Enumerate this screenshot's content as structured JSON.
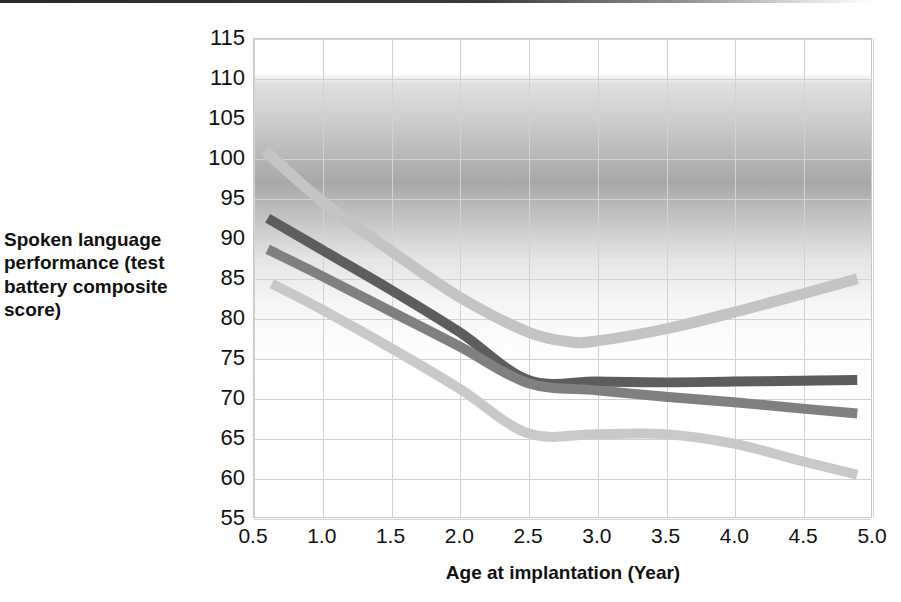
{
  "top_rule": "divider",
  "chart_data": {
    "type": "line",
    "title": "",
    "xlabel": "Age at implantation (Year)",
    "ylabel": "Spoken language performance (test battery composite score)",
    "xlim": [
      0.5,
      5.0
    ],
    "ylim": [
      55,
      115
    ],
    "xticks": [
      "0.5",
      "1.0",
      "1.5",
      "2.0",
      "2.5",
      "3.0",
      "3.5",
      "4.0",
      "4.5",
      "5.0"
    ],
    "xtick_values": [
      0.5,
      1.0,
      1.5,
      2.0,
      2.5,
      3.0,
      3.5,
      4.0,
      4.5,
      5.0
    ],
    "yticks": [
      "115",
      "110",
      "105",
      "100",
      "95",
      "90",
      "85",
      "80",
      "75",
      "70",
      "65",
      "60",
      "55"
    ],
    "ytick_values": [
      115,
      110,
      105,
      100,
      95,
      90,
      85,
      80,
      75,
      70,
      65,
      60,
      55
    ],
    "grid": true,
    "legend": "none",
    "series": [
      {
        "name": "series-1-light-upper",
        "color": "#c4c4c4",
        "width": 11,
        "x": [
          0.58,
          1.0,
          1.5,
          2.0,
          2.5,
          2.8,
          3.0,
          3.5,
          4.0,
          4.5,
          4.9
        ],
        "y": [
          101.0,
          94.6,
          88.4,
          82.6,
          78.2,
          77.0,
          77.1,
          78.6,
          80.7,
          83.0,
          84.9
        ]
      },
      {
        "name": "series-2-dark",
        "color": "#5d5d5d",
        "width": 10,
        "x": [
          0.6,
          1.0,
          1.5,
          2.0,
          2.5,
          3.0,
          3.5,
          4.0,
          4.5,
          4.9
        ],
        "y": [
          92.5,
          88.5,
          83.5,
          78.2,
          72.2,
          72.0,
          71.9,
          72.0,
          72.1,
          72.2
        ]
      },
      {
        "name": "series-3-medium",
        "color": "#808080",
        "width": 10,
        "x": [
          0.6,
          1.0,
          1.5,
          2.0,
          2.5,
          3.0,
          3.5,
          4.0,
          4.5,
          4.9
        ],
        "y": [
          88.6,
          85.2,
          80.8,
          76.4,
          71.8,
          70.9,
          70.1,
          69.4,
          68.6,
          68.0
        ]
      },
      {
        "name": "series-4-light-lower",
        "color": "#c9c9c9",
        "width": 10,
        "x": [
          0.63,
          1.0,
          1.5,
          2.0,
          2.5,
          3.0,
          3.5,
          4.0,
          4.5,
          4.9
        ],
        "y": [
          84.3,
          81.0,
          76.2,
          71.1,
          65.5,
          65.4,
          65.4,
          64.2,
          62.0,
          60.3
        ]
      }
    ]
  }
}
